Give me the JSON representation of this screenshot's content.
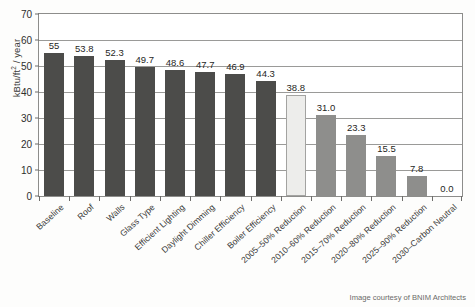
{
  "chart_data": {
    "type": "bar",
    "title": "",
    "subtitle": "",
    "xlabel": "",
    "ylabel": "kBtu/ft² / year",
    "ylim": [
      0,
      70
    ],
    "yticks": [
      0,
      10,
      20,
      30,
      40,
      50,
      60,
      70
    ],
    "grid": true,
    "legend": false,
    "categories": [
      "Baseline",
      "Roof",
      "Walls",
      "Glass Type",
      "Efficient Lighting",
      "Daylight Dimming",
      "Chiller Efficiency",
      "Boiler Efficiency",
      "2005–50% Reduction",
      "2010–60% Reduction",
      "2015–70% Reduction",
      "2020–80% Reduction",
      "2025–90% Reduction",
      "2030–Carbon Neutral"
    ],
    "values": [
      55,
      53.8,
      52.3,
      49.7,
      48.6,
      47.7,
      46.9,
      44.3,
      38.8,
      31.0,
      23.3,
      15.5,
      7.8,
      0.0
    ],
    "value_labels": [
      "55",
      "53.8",
      "52.3",
      "49.7",
      "48.6",
      "47.7",
      "46.9",
      "44.3",
      "38.8",
      "31.0",
      "23.3",
      "15.5",
      "7.8",
      "0.0"
    ],
    "bar_styles": [
      "dark",
      "dark",
      "dark",
      "dark",
      "dark",
      "dark",
      "dark",
      "dark",
      "light",
      "mid",
      "mid",
      "mid",
      "mid",
      "none"
    ],
    "colors": {
      "dark": "#4c4c4a",
      "mid": "#8e8e8c",
      "light": "#ededeb",
      "axis": "#8d8d8b",
      "grid": "#9a9a98",
      "text": "#2e2e2c"
    }
  },
  "credit": "Image courtesy of BNIM Architects"
}
